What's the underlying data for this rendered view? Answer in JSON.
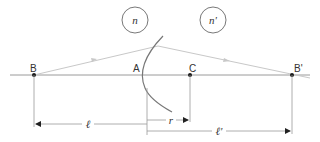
{
  "diagram": {
    "points": {
      "B": "B",
      "A": "A",
      "C": "C",
      "B_prime": "B'"
    },
    "media": {
      "left": "n",
      "right": "n'"
    },
    "dimensions": {
      "object_distance": "ℓ",
      "radius": "r",
      "image_distance": "ℓ'"
    },
    "colors": {
      "axis": "#9a9a9a",
      "ray": "#c8c8c8",
      "surface": "#777777",
      "point": "#1a1a1a",
      "text": "#333333"
    }
  }
}
